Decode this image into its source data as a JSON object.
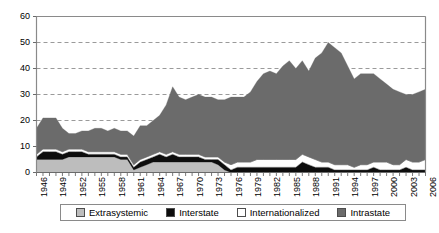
{
  "chart_data": {
    "type": "area",
    "stacked": true,
    "title": "",
    "subtitle": "",
    "xlabel": "",
    "ylabel": "",
    "xlim": [
      1946,
      2006
    ],
    "ylim": [
      0,
      60
    ],
    "yticks": [
      0,
      10,
      20,
      30,
      40,
      50,
      60
    ],
    "grid": "horizontal-dashed",
    "legend_position": "bottom",
    "x": [
      1946,
      1947,
      1948,
      1949,
      1950,
      1951,
      1952,
      1953,
      1954,
      1955,
      1956,
      1957,
      1958,
      1959,
      1960,
      1961,
      1962,
      1963,
      1964,
      1965,
      1966,
      1967,
      1968,
      1969,
      1970,
      1971,
      1972,
      1973,
      1974,
      1975,
      1976,
      1977,
      1978,
      1979,
      1980,
      1981,
      1982,
      1983,
      1984,
      1985,
      1986,
      1987,
      1988,
      1989,
      1990,
      1991,
      1992,
      1993,
      1994,
      1995,
      1996,
      1997,
      1998,
      1999,
      2000,
      2001,
      2002,
      2003,
      2004,
      2005,
      2006
    ],
    "xticks": [
      1946,
      1949,
      1952,
      1955,
      1958,
      1961,
      1964,
      1967,
      1970,
      1973,
      1976,
      1979,
      1982,
      1985,
      1988,
      1991,
      1994,
      1997,
      2000,
      2003,
      2006
    ],
    "series": [
      {
        "name": "Extrasystemic",
        "color": "#bdbdbd",
        "values": [
          5,
          5,
          5,
          5,
          5,
          6,
          6,
          6,
          6,
          6,
          6,
          6,
          6,
          5,
          5,
          1,
          2,
          3,
          4,
          4,
          4,
          4,
          4,
          4,
          4,
          4,
          4,
          4,
          3,
          1,
          0,
          0,
          0,
          0,
          0,
          0,
          0,
          0,
          0,
          0,
          0,
          0,
          0,
          0,
          0,
          0,
          0,
          0,
          0,
          0,
          0,
          0,
          0,
          0,
          0,
          0,
          0,
          0,
          0,
          0,
          0
        ]
      },
      {
        "name": "Interstate",
        "color": "#0d0d0d",
        "values": [
          1,
          3,
          3,
          3,
          2,
          2,
          2,
          2,
          1,
          1,
          1,
          1,
          1,
          1,
          1,
          1,
          2,
          2,
          2,
          3,
          2,
          3,
          2,
          2,
          2,
          2,
          1,
          1,
          2,
          2,
          1,
          2,
          2,
          2,
          2,
          2,
          2,
          2,
          2,
          2,
          2,
          4,
          3,
          2,
          2,
          2,
          1,
          1,
          1,
          1,
          1,
          1,
          2,
          1,
          1,
          1,
          1,
          2,
          1,
          1,
          1
        ]
      },
      {
        "name": "Internationalized",
        "color": "#ffffff",
        "values": [
          1,
          1,
          1,
          1,
          1,
          1,
          1,
          1,
          1,
          1,
          1,
          1,
          1,
          1,
          1,
          1,
          1,
          1,
          1,
          1,
          1,
          1,
          1,
          1,
          1,
          1,
          1,
          1,
          1,
          1,
          2,
          2,
          2,
          2,
          3,
          3,
          3,
          3,
          3,
          3,
          3,
          3,
          3,
          3,
          2,
          2,
          2,
          2,
          2,
          1,
          2,
          2,
          2,
          3,
          3,
          2,
          2,
          3,
          3,
          3,
          4
        ]
      },
      {
        "name": "Intrastate",
        "color": "#6b6b6b",
        "values": [
          10,
          12,
          12,
          12,
          9,
          6,
          6,
          7,
          8,
          9,
          9,
          8,
          9,
          9,
          9,
          11,
          13,
          12,
          13,
          14,
          19,
          25,
          22,
          21,
          22,
          23,
          23,
          23,
          22,
          24,
          26,
          25,
          25,
          27,
          30,
          33,
          34,
          33,
          36,
          38,
          35,
          36,
          33,
          39,
          42,
          46,
          45,
          43,
          38,
          34,
          35,
          35,
          34,
          32,
          30,
          29,
          28,
          25,
          26,
          27,
          27
        ]
      }
    ]
  },
  "legend": {
    "items": [
      {
        "label": "Extrasystemic",
        "color": "#bdbdbd"
      },
      {
        "label": "Interstate",
        "color": "#0d0d0d"
      },
      {
        "label": "Internationalized",
        "color": "#ffffff"
      },
      {
        "label": "Intrastate",
        "color": "#6b6b6b"
      }
    ]
  },
  "axes": {
    "y_labels": [
      "60",
      "50",
      "40",
      "30",
      "20",
      "10",
      "0"
    ],
    "x_labels": [
      "1946",
      "1949",
      "1952",
      "1955",
      "1958",
      "1961",
      "1964",
      "1967",
      "1970",
      "1973",
      "1976",
      "1979",
      "1982",
      "1985",
      "1988",
      "1991",
      "1994",
      "1997",
      "2000",
      "2003",
      "2006"
    ]
  }
}
